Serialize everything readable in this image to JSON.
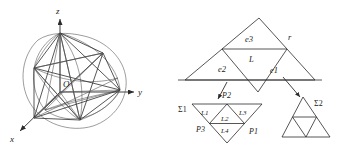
{
  "figure": {
    "background_color": "#ffffff",
    "line_color": "#3d3d3d",
    "panels": [
      {
        "id": "left",
        "name": "octahedron-in-sphere"
      },
      {
        "id": "right",
        "name": "triangle-subdivision-diagram"
      }
    ]
  },
  "left_panel": {
    "name": "octahedron-inscribed-in-sphere",
    "axes": {
      "z_label": "z",
      "y_label": "y",
      "x_label": "x"
    },
    "origin_label": "O"
  },
  "right_panel": {
    "name": "subdivision-diagram",
    "main_triangle": {
      "edge_labels": {
        "e1": "e1",
        "e2": "e2",
        "e3": "e3"
      },
      "center_label": "L",
      "vertex_label": "r"
    },
    "sigma1": {
      "name": "sigma1-inverted-triangle",
      "label": "Σ1",
      "sub_labels": {
        "L1": "L1",
        "L2": "L2",
        "L3": "L3",
        "L4": "L4"
      },
      "point_labels": {
        "P1": "P1",
        "P2": "P2",
        "P3": "P3"
      }
    },
    "sigma2": {
      "name": "sigma2-upright-triangle",
      "label": "Σ2"
    }
  }
}
